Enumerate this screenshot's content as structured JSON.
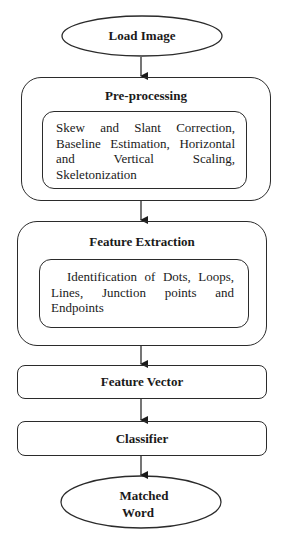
{
  "diagram": {
    "type": "flowchart",
    "start": {
      "label": "Load Image"
    },
    "preprocessing": {
      "title": "Pre-processing",
      "details_lines": [
        "Skew and Slant Correction,",
        "Baseline Estimation, Horizontal",
        "and Vertical Scaling,",
        "Skeletonization"
      ]
    },
    "feature_extraction": {
      "title": "Feature Extraction",
      "details_lines": [
        "Identification of Dots, Loops,",
        "Lines, Junction points and",
        "Endpoints"
      ]
    },
    "feature_vector": {
      "label": "Feature Vector"
    },
    "classifier": {
      "label": "Classifier"
    },
    "end": {
      "label_line1": "Matched",
      "label_line2": "Word"
    },
    "edges": [
      [
        "Load Image",
        "Pre-processing"
      ],
      [
        "Pre-processing",
        "Feature Extraction"
      ],
      [
        "Feature Extraction",
        "Feature Vector"
      ],
      [
        "Feature Vector",
        "Classifier"
      ],
      [
        "Classifier",
        "Matched Word"
      ]
    ]
  }
}
